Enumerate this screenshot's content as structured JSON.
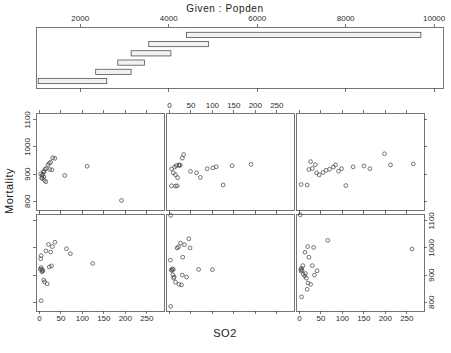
{
  "title": "Given :  Popden",
  "xlabel": "SO2",
  "ylabel": "Mortality",
  "chart_data": {
    "type": "scatter",
    "plot_kind": "coplot",
    "title": "Given :  Popden",
    "xlabel": "SO2",
    "ylabel": "Mortality",
    "given_variable": "Popden",
    "conditioning_axis": {
      "label": "Popden",
      "ticks": [
        2000,
        4000,
        6000,
        8000,
        10000
      ],
      "range": [
        1000,
        10200
      ]
    },
    "xaxis": {
      "ticks": [
        0,
        50,
        100,
        150,
        200,
        250
      ],
      "range": [
        -8,
        290
      ],
      "grid": false
    },
    "yaxis": {
      "ticks": [
        800,
        900,
        1000,
        1100
      ],
      "range": [
        768,
        1125
      ],
      "grid": false
    },
    "given_intervals": [
      {
        "index": 1,
        "row": 6,
        "from": 1050,
        "to": 2600
      },
      {
        "index": 2,
        "row": 5,
        "from": 2350,
        "to": 3150
      },
      {
        "index": 3,
        "row": 4,
        "from": 2850,
        "to": 3450
      },
      {
        "index": 4,
        "row": 3,
        "from": 3150,
        "to": 4050
      },
      {
        "index": 5,
        "row": 2,
        "from": 3550,
        "to": 4900
      },
      {
        "index": 6,
        "row": 1,
        "from": 4400,
        "to": 9700
      }
    ],
    "panels": [
      {
        "panel": "bottom-left",
        "row": 2,
        "col": 1,
        "interval_index": 1,
        "points": [
          [
            2,
            922
          ],
          [
            4,
            928
          ],
          [
            7,
            918
          ],
          [
            8,
            916
          ],
          [
            5,
            921
          ],
          [
            6,
            912
          ],
          [
            3,
            960
          ],
          [
            4,
            972
          ],
          [
            10,
            882
          ],
          [
            12,
            875
          ],
          [
            18,
            868
          ],
          [
            21,
            1013
          ],
          [
            15,
            989
          ],
          [
            26,
            985
          ],
          [
            30,
            1005
          ],
          [
            36,
            1021
          ],
          [
            28,
            934
          ],
          [
            23,
            930
          ],
          [
            63,
            997
          ],
          [
            72,
            979
          ],
          [
            124,
            943
          ],
          [
            4,
            806
          ]
        ]
      },
      {
        "panel": "bottom-middle",
        "row": 2,
        "col": 2,
        "interval_index": 2,
        "points": [
          [
            3,
            1120
          ],
          [
            2,
            955
          ],
          [
            4,
            919
          ],
          [
            7,
            923
          ],
          [
            9,
            921
          ],
          [
            6,
            917
          ],
          [
            8,
            901
          ],
          [
            10,
            889
          ],
          [
            11,
            893
          ],
          [
            14,
            874
          ],
          [
            22,
            866
          ],
          [
            28,
            864
          ],
          [
            18,
            1000
          ],
          [
            21,
            1004
          ],
          [
            26,
            1018
          ],
          [
            35,
            1012
          ],
          [
            31,
            966
          ],
          [
            45,
            1034
          ],
          [
            48,
            1000
          ],
          [
            40,
            893
          ],
          [
            30,
            900
          ],
          [
            68,
            921
          ],
          [
            100,
            920
          ],
          [
            3,
            785
          ]
        ]
      },
      {
        "panel": "bottom-right",
        "row": 2,
        "col": 3,
        "interval_index": 3,
        "points": [
          [
            2,
            1122
          ],
          [
            3,
            921
          ],
          [
            5,
            925
          ],
          [
            6,
            918
          ],
          [
            4,
            915
          ],
          [
            8,
            935
          ],
          [
            9,
            903
          ],
          [
            12,
            897
          ],
          [
            14,
            906
          ],
          [
            16,
            889
          ],
          [
            20,
            871
          ],
          [
            26,
            866
          ],
          [
            13,
            984
          ],
          [
            19,
            1005
          ],
          [
            22,
            966
          ],
          [
            33,
            1002
          ],
          [
            30,
            935
          ],
          [
            41,
            916
          ],
          [
            35,
            900
          ],
          [
            18,
            848
          ],
          [
            66,
            1028
          ],
          [
            262,
            996
          ],
          [
            5,
            820
          ]
        ]
      },
      {
        "panel": "top-left",
        "row": 1,
        "col": 1,
        "interval_index": 4,
        "points": [
          [
            3,
            901
          ],
          [
            6,
            895
          ],
          [
            8,
            899
          ],
          [
            9,
            908
          ],
          [
            11,
            910
          ],
          [
            5,
            886
          ],
          [
            7,
            884
          ],
          [
            10,
            890
          ],
          [
            13,
            918
          ],
          [
            16,
            921
          ],
          [
            12,
            877
          ],
          [
            15,
            872
          ],
          [
            23,
            940
          ],
          [
            26,
            944
          ],
          [
            31,
            960
          ],
          [
            36,
            958
          ],
          [
            24,
            917
          ],
          [
            29,
            916
          ],
          [
            20,
            934
          ],
          [
            59,
            895
          ],
          [
            111,
            929
          ],
          [
            191,
            803
          ]
        ]
      },
      {
        "panel": "top-middle",
        "row": 1,
        "col": 2,
        "interval_index": 5,
        "points": [
          [
            5,
            919
          ],
          [
            12,
            926
          ],
          [
            16,
            931
          ],
          [
            22,
            934
          ],
          [
            25,
            933
          ],
          [
            23,
            932
          ],
          [
            9,
            905
          ],
          [
            14,
            898
          ],
          [
            19,
            887
          ],
          [
            30,
            959
          ],
          [
            33,
            972
          ],
          [
            5,
            857
          ],
          [
            14,
            856
          ],
          [
            18,
            857
          ],
          [
            49,
            910
          ],
          [
            63,
            905
          ],
          [
            72,
            888
          ],
          [
            88,
            920
          ],
          [
            101,
            923
          ],
          [
            125,
            860
          ],
          [
            109,
            927
          ],
          [
            146,
            931
          ],
          [
            190,
            936
          ]
        ]
      },
      {
        "panel": "top-right",
        "row": 1,
        "col": 3,
        "interval_index": 6,
        "points": [
          [
            4,
            862
          ],
          [
            18,
            860
          ],
          [
            26,
            946
          ],
          [
            22,
            917
          ],
          [
            30,
            921
          ],
          [
            37,
            935
          ],
          [
            40,
            905
          ],
          [
            46,
            897
          ],
          [
            55,
            906
          ],
          [
            62,
            914
          ],
          [
            70,
            918
          ],
          [
            79,
            926
          ],
          [
            84,
            934
          ],
          [
            91,
            911
          ],
          [
            98,
            920
          ],
          [
            108,
            858
          ],
          [
            125,
            927
          ],
          [
            150,
            930
          ],
          [
            164,
            920
          ],
          [
            198,
            975
          ],
          [
            212,
            934
          ],
          [
            265,
            938
          ]
        ]
      }
    ]
  },
  "given_axis_ticks": [
    "2000",
    "4000",
    "6000",
    "8000",
    "10000"
  ],
  "x_axis_ticks": [
    "0",
    "50",
    "100",
    "150",
    "200",
    "250"
  ],
  "y_axis_ticks": [
    "800",
    "900",
    "1000",
    "1100"
  ]
}
